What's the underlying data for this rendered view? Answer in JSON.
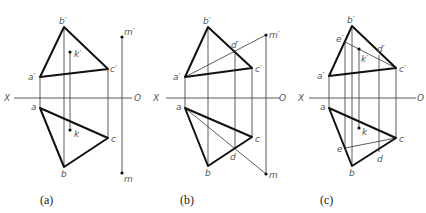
{
  "figure": {
    "panels": [
      {
        "caption": "(a)",
        "axis": {
          "left_label": "X",
          "right_label": "O"
        },
        "labels": {
          "b_prime": "b′",
          "a_prime": "a′",
          "c_prime": "c′",
          "k_prime": "k′",
          "m_prime": "m′",
          "a": "a",
          "b": "b",
          "c": "c",
          "k": "k",
          "m": "m"
        }
      },
      {
        "caption": "(b)",
        "axis": {
          "left_label": "X",
          "right_label": "O"
        },
        "labels": {
          "b_prime": "b′",
          "a_prime": "a′",
          "c_prime": "c′",
          "d_prime": "d′",
          "m_prime": "m′",
          "a": "a",
          "b": "b",
          "c": "c",
          "d": "d",
          "m": "m"
        }
      },
      {
        "caption": "(c)",
        "axis": {
          "left_label": "X",
          "right_label": "O"
        },
        "labels": {
          "b_prime": "b′",
          "e_prime": "e′",
          "a_prime": "a′",
          "c_prime": "c′",
          "d_prime": "d′",
          "k_prime": "k′",
          "a": "a",
          "b": "b",
          "c": "c",
          "d": "d",
          "e": "e",
          "k": "k"
        }
      }
    ]
  }
}
